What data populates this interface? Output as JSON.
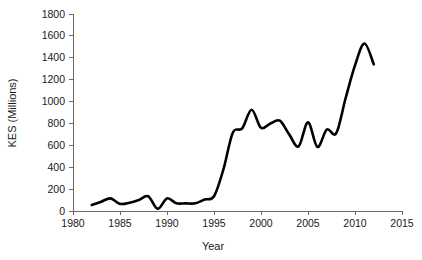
{
  "chart_data": {
    "type": "line",
    "title": "",
    "xlabel": "Year",
    "ylabel": "KES (Millions)",
    "xlim": [
      1980,
      2015
    ],
    "ylim": [
      0,
      1800
    ],
    "xticks": [
      1980,
      1985,
      1990,
      1995,
      2000,
      2005,
      2010,
      2015
    ],
    "yticks": [
      0,
      200,
      400,
      600,
      800,
      1000,
      1200,
      1400,
      1600,
      1800
    ],
    "grid": false,
    "legend": null,
    "line_color": "#000000",
    "axis_color": "#6b6b6b",
    "series": [
      {
        "name": "KES (Millions)",
        "x": [
          1982,
          1983,
          1984,
          1985,
          1986,
          1987,
          1988,
          1989,
          1990,
          1991,
          1992,
          1993,
          1994,
          1995,
          1996,
          1997,
          1998,
          1999,
          2000,
          2001,
          2002,
          2003,
          2004,
          2005,
          2006,
          2007,
          2008,
          2009,
          2010,
          2011,
          2012
        ],
        "values": [
          55,
          85,
          115,
          65,
          75,
          100,
          135,
          20,
          115,
          70,
          70,
          70,
          105,
          135,
          380,
          715,
          755,
          925,
          760,
          800,
          825,
          700,
          590,
          810,
          585,
          745,
          710,
          1030,
          1330,
          1530,
          1340
        ]
      }
    ]
  },
  "axis_labels": {
    "x_title": "Year",
    "y_title": "KES (Millions)"
  }
}
